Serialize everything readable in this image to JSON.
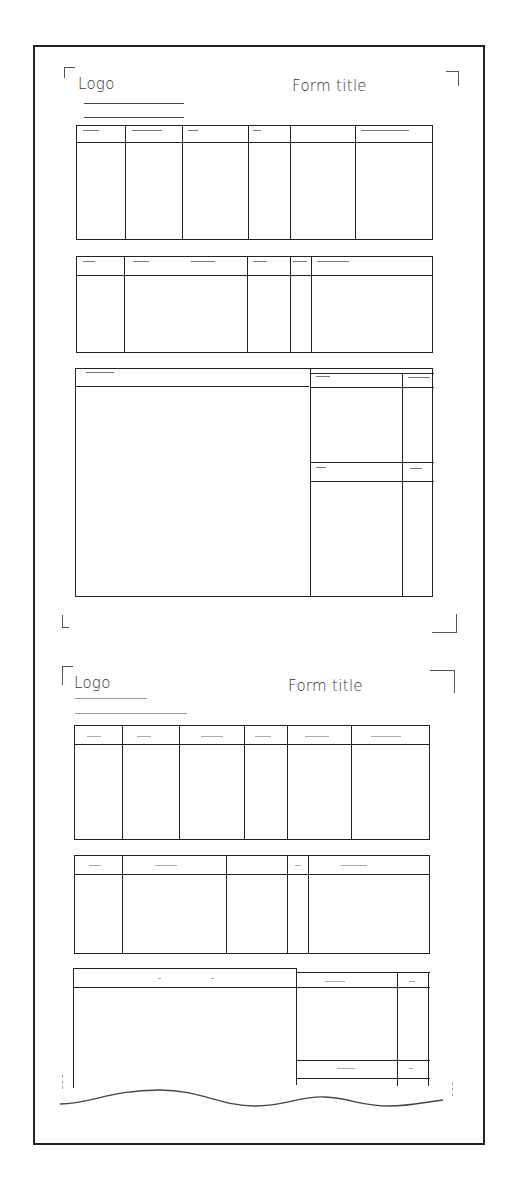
{
  "sheet": {
    "description": "Two stacked form layout templates, the second truncated with a wavy break line"
  },
  "forms": [
    {
      "logo_label": "Logo",
      "title_label": "Form title",
      "tables": [
        {
          "name": "table-1",
          "columns": 6,
          "header_row": true
        },
        {
          "name": "table-2",
          "columns": 5,
          "header_row": true
        },
        {
          "name": "table-3",
          "columns": 3,
          "header_row": true,
          "right_sub_header": true
        }
      ]
    },
    {
      "logo_label": "Logo",
      "title_label": "Form title",
      "tables": [
        {
          "name": "table-1",
          "columns": 6,
          "header_row": true
        },
        {
          "name": "table-2",
          "columns": 5,
          "header_row": true
        },
        {
          "name": "table-3",
          "columns": 3,
          "header_row": true,
          "right_sub_header": true,
          "truncated": true
        }
      ]
    }
  ],
  "colors": {
    "line": "#222222",
    "background": "#ffffff"
  }
}
